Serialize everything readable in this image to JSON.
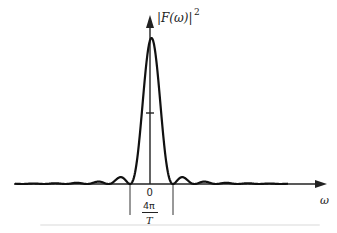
{
  "figure": {
    "y_axis_label_main": "|F(ω)|",
    "y_axis_label_exp": "2",
    "x_axis_label": "ω",
    "origin_label": "0",
    "width_label_num": "4π",
    "width_label_den": "T",
    "caption": "",
    "colors": {
      "curve": "#111111",
      "axis": "#222222",
      "guide": "#333333",
      "caption": "#ececec"
    }
  },
  "chart_data": {
    "type": "line",
    "title": "",
    "xlabel": "ω",
    "ylabel": "|F(ω)|²",
    "function": "sinc² (main lobe with decaying side lobes)",
    "main_lobe_width_label": "4π/T",
    "x_ticks": [
      "0"
    ],
    "half_max_tick": true,
    "grid": false,
    "legend": null,
    "x_range_units_of_pi_over_halfT": [
      -6.5,
      6.5
    ],
    "ylim": [
      0,
      1
    ],
    "samples": {
      "x": [
        -6.5,
        -6,
        -5.5,
        -5,
        -4.5,
        -4,
        -3.5,
        -3,
        -2.5,
        -2,
        -1.5,
        -1,
        -0.5,
        0,
        0.5,
        1,
        1.5,
        2,
        2.5,
        3,
        3.5,
        4,
        4.5,
        5,
        5.5,
        6,
        6.5
      ],
      "y": [
        0.0096,
        0,
        0.0134,
        0,
        0.02,
        0,
        0.033,
        0,
        0.065,
        0,
        0.18,
        0,
        0.405,
        1,
        0.405,
        0,
        0.18,
        0,
        0.065,
        0,
        0.033,
        0,
        0.02,
        0,
        0.0134,
        0,
        0.0096
      ]
    }
  }
}
